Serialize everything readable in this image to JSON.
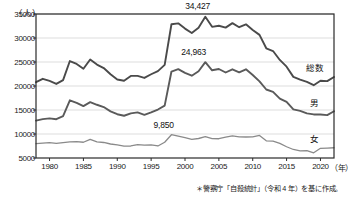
{
  "chart_data": {
    "type": "line",
    "title": "",
    "xlabel": "（年）",
    "ylabel": "（人）",
    "xlim": [
      1978,
      2022
    ],
    "ylim": [
      5000,
      35000
    ],
    "grid": true,
    "legend_position": "inline-right",
    "xticks": [
      1980,
      1985,
      1990,
      1995,
      2000,
      2005,
      2010,
      2015,
      2020
    ],
    "yticks": [
      5000,
      10000,
      15000,
      20000,
      25000,
      30000,
      35000
    ],
    "x": [
      1978,
      1979,
      1980,
      1981,
      1982,
      1983,
      1984,
      1985,
      1986,
      1987,
      1988,
      1989,
      1990,
      1991,
      1992,
      1993,
      1994,
      1995,
      1996,
      1997,
      1998,
      1999,
      2000,
      2001,
      2002,
      2003,
      2004,
      2005,
      2006,
      2007,
      2008,
      2009,
      2010,
      2011,
      2012,
      2013,
      2014,
      2015,
      2016,
      2017,
      2018,
      2019,
      2020,
      2021,
      2022
    ],
    "series": [
      {
        "name": "総数",
        "label": "総数",
        "color": "#4a4a4a",
        "values": [
          20788,
          21503,
          21048,
          20434,
          21228,
          25202,
          24596,
          23599,
          25524,
          24460,
          23742,
          22436,
          21346,
          21084,
          22104,
          22104,
          21679,
          22445,
          23104,
          24391,
          32863,
          33048,
          31957,
          31042,
          32143,
          34427,
          32325,
          32552,
          32155,
          33093,
          32249,
          32845,
          31690,
          30651,
          27858,
          27283,
          25427,
          24025,
          21897,
          21321,
          20840,
          20169,
          21081,
          21007,
          21881
        ]
      },
      {
        "name": "男",
        "label": "男",
        "color": "#5a5a5a",
        "values": [
          12800,
          13103,
          13262,
          13084,
          13712,
          17026,
          16504,
          15820,
          16632,
          16090,
          15610,
          14720,
          14123,
          13800,
          14300,
          14500,
          14000,
          14500,
          15100,
          15900,
          23013,
          23512,
          22727,
          22144,
          23080,
          24963,
          23272,
          23540,
          22813,
          23478,
          22831,
          23472,
          22283,
          20955,
          19273,
          18787,
          17386,
          16681,
          15121,
          14826,
          14290,
          14078,
          14055,
          13939,
          14746
        ]
      },
      {
        "name": "女",
        "label": "女",
        "color": "#8a8a8a",
        "values": [
          7988,
          8100,
          8186,
          8050,
          8216,
          8376,
          8392,
          8279,
          8892,
          8370,
          8232,
          7916,
          7723,
          7484,
          7504,
          7804,
          7679,
          7745,
          7504,
          8291,
          9850,
          9536,
          9230,
          8898,
          9063,
          9464,
          9053,
          9012,
          9342,
          9615,
          9418,
          9373,
          9407,
          9696,
          8585,
          8496,
          8041,
          7344,
          6776,
          6495,
          6550,
          6091,
          7026,
          7068,
          7135
        ]
      }
    ],
    "annotations": [
      {
        "id": "peak-total",
        "text": "34,427",
        "year": 2003,
        "value": 34427,
        "series": "総数"
      },
      {
        "id": "peak-male",
        "text": "24,963",
        "year": 2003,
        "value": 24963,
        "series": "男"
      },
      {
        "id": "peak-female",
        "text": "9,850",
        "year": 1998,
        "value": 9850,
        "series": "女"
      }
    ],
    "source_note": "＊警察庁「自殺統計」（令和 4 年）を基に作成。"
  }
}
